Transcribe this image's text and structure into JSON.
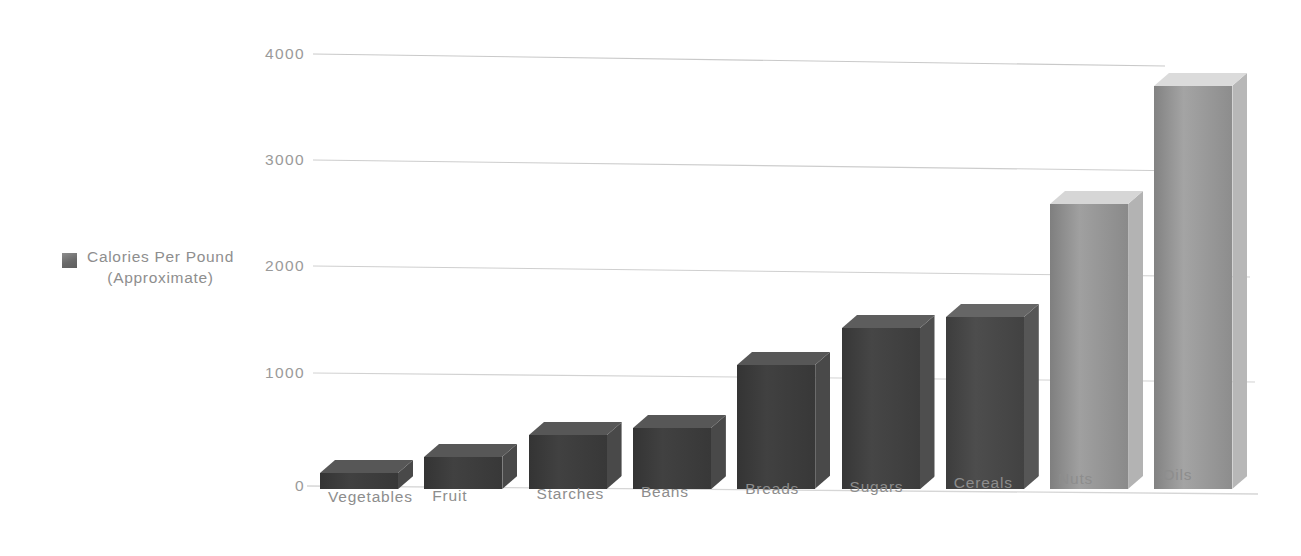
{
  "legend": {
    "label": "Calories Per Pound\n(Approximate)",
    "swatch_color": "#6e6e6e"
  },
  "axis": {
    "y_ticks": [
      "0",
      "1000",
      "2000",
      "3000",
      "4000"
    ],
    "tick_color": "#9a9a9a",
    "gridline_color": "#cfcfcf"
  },
  "chart_data": {
    "type": "bar",
    "title": "",
    "subtitle": "",
    "xlabel": "",
    "ylabel": "Calories Per Pound (Approximate)",
    "ylim": [
      0,
      4000
    ],
    "ytick_values": [
      0,
      1000,
      2000,
      3000,
      4000
    ],
    "grid": true,
    "legend_position": "left",
    "legend_entries": [
      "Calories Per Pound (Approximate)"
    ],
    "style": "hand-drawn 3d bars",
    "categories": [
      "Vegetables",
      "Fruit",
      "Starches",
      "Beans",
      "Breads",
      "Sugars",
      "Cereals",
      "Nuts",
      "Oils"
    ],
    "values": [
      150,
      300,
      500,
      570,
      1150,
      1500,
      1600,
      2650,
      3750
    ],
    "series": [
      {
        "name": "Calories Per Pound (Approximate)",
        "values": [
          150,
          300,
          500,
          570,
          1150,
          1500,
          1600,
          2650,
          3750
        ]
      }
    ],
    "bar_colors": [
      "#383838",
      "#383838",
      "#383838",
      "#383838",
      "#383838",
      "#3c3c3c",
      "#424242",
      "#8a8a8a",
      "#8d8d8d"
    ]
  }
}
